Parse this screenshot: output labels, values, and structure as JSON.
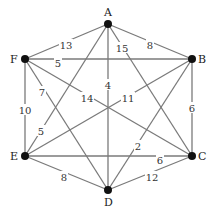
{
  "diagram": {
    "type": "weighted-undirected-graph",
    "nodes": [
      {
        "id": "A",
        "x": 108,
        "y": 24,
        "lx": 104,
        "ly": 16
      },
      {
        "id": "B",
        "x": 192,
        "y": 59,
        "lx": 198,
        "ly": 63
      },
      {
        "id": "C",
        "x": 192,
        "y": 156,
        "lx": 198,
        "ly": 160
      },
      {
        "id": "D",
        "x": 108,
        "y": 190,
        "lx": 104,
        "ly": 206
      },
      {
        "id": "E",
        "x": 25,
        "y": 156,
        "lx": 10,
        "ly": 160
      },
      {
        "id": "F",
        "x": 25,
        "y": 59,
        "lx": 10,
        "ly": 63
      }
    ],
    "edges": [
      {
        "from": "A",
        "to": "F",
        "weight": "13",
        "lx": 66,
        "ly": 45
      },
      {
        "from": "A",
        "to": "B",
        "weight": "8",
        "lx": 150,
        "ly": 45
      },
      {
        "from": "F",
        "to": "B",
        "weight": "5",
        "lx": 58,
        "ly": 63
      },
      {
        "from": "A",
        "to": "D",
        "weight": "4",
        "lx": 108,
        "ly": 85
      },
      {
        "from": "A",
        "to": "C",
        "weight": "15",
        "lx": 122,
        "ly": 48
      },
      {
        "from": "F",
        "to": "C",
        "weight": "14",
        "lx": 87,
        "ly": 98
      },
      {
        "from": "E",
        "to": "B",
        "weight": "11",
        "lx": 128,
        "ly": 98
      },
      {
        "from": "F",
        "to": "D",
        "weight": "7",
        "lx": 42,
        "ly": 92
      },
      {
        "from": "A",
        "to": "E",
        "weight": "5",
        "lx": 41,
        "ly": 131
      },
      {
        "from": "F",
        "to": "E",
        "weight": "10",
        "lx": 25,
        "ly": 110
      },
      {
        "from": "B",
        "to": "C",
        "weight": "6",
        "lx": 192,
        "ly": 108
      },
      {
        "from": "B",
        "to": "D",
        "weight": "2",
        "lx": 138,
        "ly": 146
      },
      {
        "from": "E",
        "to": "C",
        "weight": "6",
        "lx": 160,
        "ly": 160
      },
      {
        "from": "E",
        "to": "D",
        "weight": "8",
        "lx": 64,
        "ly": 177
      },
      {
        "from": "D",
        "to": "C",
        "weight": "12",
        "lx": 152,
        "ly": 177
      }
    ]
  }
}
